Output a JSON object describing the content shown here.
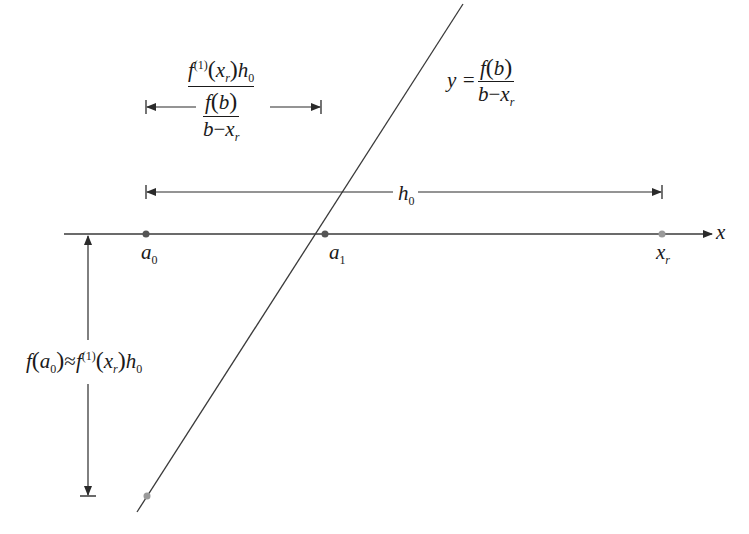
{
  "diagram": {
    "type": "secant-iteration-geometry",
    "colors": {
      "line": "#3a3a3a",
      "point_dark": "#555555",
      "point_light": "#9a9a9a",
      "background": "#ffffff"
    },
    "axis": {
      "label": "x"
    },
    "points": [
      {
        "id": "a0",
        "base": "a",
        "sub": "0"
      },
      {
        "id": "a1",
        "base": "a",
        "sub": "1"
      },
      {
        "id": "xr",
        "base": "x",
        "sub": "r"
      }
    ],
    "line_label": {
      "lhs": "y =",
      "numerator": "f(b)",
      "num_f": "f",
      "num_arg": "b",
      "denominator_b": "b",
      "denominator_minus": "−",
      "denominator_x": "x",
      "denominator_sub": "r"
    },
    "h0_label": {
      "base": "h",
      "sub": "0"
    },
    "top_dimension_label": {
      "num_f": "f",
      "num_sup": "(1)",
      "num_x": "x",
      "num_xsub": "r",
      "num_h": "h",
      "num_hsub": "0",
      "den_f": "f",
      "den_arg": "b",
      "den_b": "b",
      "den_minus": "−",
      "den_x": "x",
      "den_xsub": "r"
    },
    "vertical_label": {
      "f": "f",
      "arg": "a",
      "arg_sub": "0",
      "approx": "≈",
      "f2": "f",
      "sup": "(1)",
      "x": "x",
      "xsub": "r",
      "h": "h",
      "hsub": "0"
    }
  }
}
